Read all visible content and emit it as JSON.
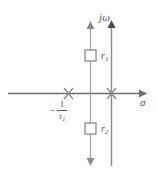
{
  "figure": {
    "kind": "s-plane pole-zero diagram",
    "width": 157,
    "height": 175,
    "background": "#ffffff",
    "line_color": "#8c8c8c",
    "axis_color": "#6e6e6e",
    "text_color": "#555555"
  },
  "axes": {
    "real": {
      "name": "sigma-axis",
      "label": "σ",
      "arrow": "right"
    },
    "imaginary": {
      "name": "jomega-axis",
      "label": "jω",
      "arrow": "up"
    }
  },
  "poles": [
    {
      "name": "pole-at-minus-one-over-tau1",
      "marker": "x",
      "label_minus": "−",
      "label_numerator": "1",
      "label_denominator": "τ",
      "label_denominator_sub": "1",
      "label_text": "−1/τ₁"
    },
    {
      "name": "pole-at-origin",
      "marker": "x",
      "label_text": ""
    }
  ],
  "root_locus": {
    "name": "vertical-root-locus-branch",
    "arrow_top": true,
    "arrow_bottom": true,
    "markers": [
      {
        "name": "root-marker-r1",
        "shape": "square",
        "label": "r",
        "label_sub": "1",
        "label_text": "r₁"
      },
      {
        "name": "root-marker-r2",
        "shape": "square",
        "label": "r",
        "label_sub": "2",
        "label_text": "r₂"
      }
    ]
  }
}
